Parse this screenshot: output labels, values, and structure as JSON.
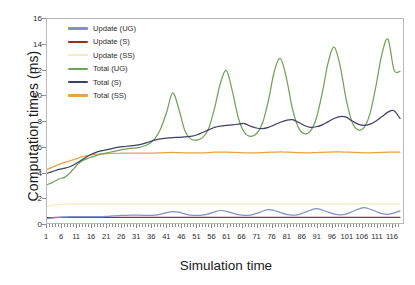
{
  "chart_data": {
    "type": "line",
    "title": "",
    "xlabel": "Simulation time",
    "ylabel": "Computation times (ms)",
    "xlim": [
      1,
      120
    ],
    "ylim": [
      0,
      16
    ],
    "ytick_step": 2,
    "xtick_step": 5,
    "grid": false,
    "legend_position": "top-left",
    "xticks": [
      1,
      6,
      11,
      16,
      21,
      26,
      31,
      36,
      41,
      46,
      51,
      56,
      61,
      66,
      71,
      76,
      81,
      86,
      91,
      96,
      101,
      106,
      111,
      116
    ],
    "yticks": [
      0,
      2,
      4,
      6,
      8,
      10,
      12,
      14,
      16
    ],
    "x": [
      1,
      3,
      5,
      7,
      9,
      11,
      13,
      15,
      17,
      19,
      21,
      23,
      25,
      27,
      29,
      31,
      33,
      35,
      37,
      39,
      41,
      43,
      45,
      47,
      49,
      51,
      53,
      55,
      57,
      59,
      61,
      63,
      65,
      67,
      69,
      71,
      73,
      75,
      77,
      79,
      81,
      83,
      85,
      87,
      89,
      91,
      93,
      95,
      97,
      99,
      101,
      103,
      105,
      107,
      109,
      111,
      113,
      115,
      117,
      119
    ],
    "series": [
      {
        "name": "Update (UG)",
        "color": "#8193c6",
        "values": [
          0.35,
          0.4,
          0.45,
          0.48,
          0.5,
          0.5,
          0.5,
          0.5,
          0.5,
          0.5,
          0.52,
          0.55,
          0.58,
          0.6,
          0.62,
          0.62,
          0.6,
          0.6,
          0.62,
          0.7,
          0.82,
          0.9,
          0.85,
          0.72,
          0.62,
          0.6,
          0.62,
          0.72,
          0.88,
          0.98,
          0.92,
          0.78,
          0.65,
          0.6,
          0.62,
          0.75,
          0.92,
          1.05,
          0.98,
          0.82,
          0.68,
          0.62,
          0.66,
          0.82,
          1.0,
          1.12,
          1.02,
          0.85,
          0.7,
          0.64,
          0.7,
          0.88,
          1.08,
          1.2,
          1.08,
          0.9,
          0.74,
          0.68,
          0.78,
          0.95
        ]
      },
      {
        "name": "Update (S)",
        "color": "#a52a1e",
        "values": [
          0.42,
          0.43,
          0.44,
          0.45,
          0.45,
          0.45,
          0.45,
          0.45,
          0.45,
          0.45,
          0.45,
          0.45,
          0.45,
          0.45,
          0.45,
          0.45,
          0.45,
          0.45,
          0.45,
          0.45,
          0.45,
          0.45,
          0.45,
          0.45,
          0.45,
          0.45,
          0.45,
          0.45,
          0.45,
          0.45,
          0.45,
          0.45,
          0.45,
          0.45,
          0.45,
          0.45,
          0.45,
          0.45,
          0.45,
          0.45,
          0.45,
          0.45,
          0.45,
          0.45,
          0.45,
          0.45,
          0.45,
          0.45,
          0.45,
          0.45,
          0.45,
          0.45,
          0.45,
          0.45,
          0.45,
          0.45,
          0.45,
          0.45,
          0.45,
          0.45
        ]
      },
      {
        "name": "Update (SS)",
        "color": "#eeeebe",
        "values": [
          1.3,
          1.38,
          1.44,
          1.48,
          1.5,
          1.5,
          1.5,
          1.5,
          1.5,
          1.5,
          1.5,
          1.5,
          1.5,
          1.5,
          1.5,
          1.5,
          1.5,
          1.5,
          1.5,
          1.5,
          1.5,
          1.5,
          1.5,
          1.5,
          1.5,
          1.5,
          1.5,
          1.5,
          1.5,
          1.5,
          1.5,
          1.5,
          1.5,
          1.5,
          1.5,
          1.5,
          1.5,
          1.5,
          1.5,
          1.5,
          1.5,
          1.5,
          1.5,
          1.5,
          1.5,
          1.5,
          1.5,
          1.5,
          1.5,
          1.5,
          1.5,
          1.5,
          1.5,
          1.5,
          1.5,
          1.5,
          1.5,
          1.5,
          1.5,
          1.5
        ]
      },
      {
        "name": "Total (UG)",
        "color": "#73a15a",
        "values": [
          3.0,
          3.2,
          3.45,
          3.6,
          4.0,
          4.55,
          4.9,
          5.1,
          5.25,
          5.4,
          5.5,
          5.6,
          5.7,
          5.8,
          5.85,
          5.9,
          6.0,
          6.2,
          6.6,
          7.4,
          8.7,
          10.2,
          9.0,
          7.3,
          6.6,
          6.5,
          6.7,
          7.4,
          9.0,
          11.0,
          11.95,
          10.3,
          8.2,
          7.1,
          6.8,
          7.0,
          7.8,
          9.6,
          11.9,
          12.9,
          11.4,
          9.0,
          7.5,
          7.0,
          7.2,
          8.2,
          10.2,
          12.6,
          13.8,
          12.3,
          9.7,
          7.9,
          7.3,
          7.5,
          8.6,
          10.8,
          13.3,
          14.4,
          12.0,
          11.9
        ]
      },
      {
        "name": "Total (S)",
        "color": "#3f3f61",
        "values": [
          3.9,
          4.05,
          4.2,
          4.3,
          4.45,
          4.7,
          5.0,
          5.3,
          5.5,
          5.65,
          5.75,
          5.85,
          5.95,
          6.0,
          6.05,
          6.1,
          6.2,
          6.35,
          6.5,
          6.6,
          6.65,
          6.7,
          6.72,
          6.75,
          6.8,
          6.9,
          7.1,
          7.3,
          7.5,
          7.6,
          7.65,
          7.7,
          7.75,
          7.8,
          7.6,
          7.45,
          7.4,
          7.5,
          7.7,
          7.9,
          8.05,
          8.1,
          7.9,
          7.65,
          7.5,
          7.55,
          7.7,
          7.95,
          8.2,
          8.35,
          8.3,
          8.0,
          7.75,
          7.65,
          7.75,
          8.0,
          8.35,
          8.7,
          8.8,
          8.2
        ]
      },
      {
        "name": "Total (SS)",
        "color": "#e8a145",
        "values": [
          4.2,
          4.4,
          4.6,
          4.75,
          4.9,
          5.05,
          5.2,
          5.3,
          5.38,
          5.42,
          5.45,
          5.46,
          5.47,
          5.48,
          5.48,
          5.48,
          5.48,
          5.48,
          5.48,
          5.5,
          5.52,
          5.54,
          5.52,
          5.5,
          5.5,
          5.5,
          5.5,
          5.52,
          5.55,
          5.56,
          5.55,
          5.54,
          5.52,
          5.5,
          5.5,
          5.5,
          5.52,
          5.54,
          5.56,
          5.58,
          5.56,
          5.54,
          5.52,
          5.5,
          5.5,
          5.52,
          5.54,
          5.56,
          5.58,
          5.58,
          5.56,
          5.54,
          5.52,
          5.5,
          5.5,
          5.52,
          5.54,
          5.56,
          5.56,
          5.55
        ]
      }
    ]
  }
}
